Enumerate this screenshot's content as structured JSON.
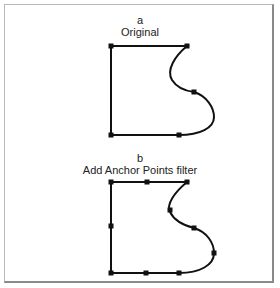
{
  "panels": [
    {
      "letter": "a",
      "title": "Original",
      "anchor_count": 5
    },
    {
      "letter": "b",
      "title": "Add Anchor Points filter",
      "anchor_count": 10
    }
  ],
  "colors": {
    "stroke": "#111111",
    "anchor": "#111111",
    "frame": "#8a8a8a",
    "text": "#222222"
  }
}
